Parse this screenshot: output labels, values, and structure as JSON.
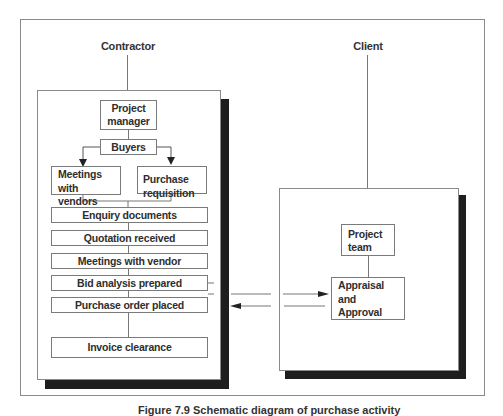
{
  "diagram": {
    "contractor": {
      "label": "Contractor",
      "nodes": {
        "project_manager": "Project manager",
        "buyers": "Buyers",
        "meetings_with_vendors": "Meetings with vendors",
        "purchase_requisition": "Purchase requisition"
      },
      "steps": [
        "Enquiry documents",
        "Quotation received",
        "Meetings with vendor",
        "Bid analysis prepared",
        "Purchase order placed",
        "Invoice clearance"
      ]
    },
    "client": {
      "label": "Client",
      "nodes": {
        "project_team": "Project team",
        "appraisal": "Appraisal and Approval"
      }
    },
    "caption": "Figure 7.9  Schematic diagram of purchase activity"
  }
}
